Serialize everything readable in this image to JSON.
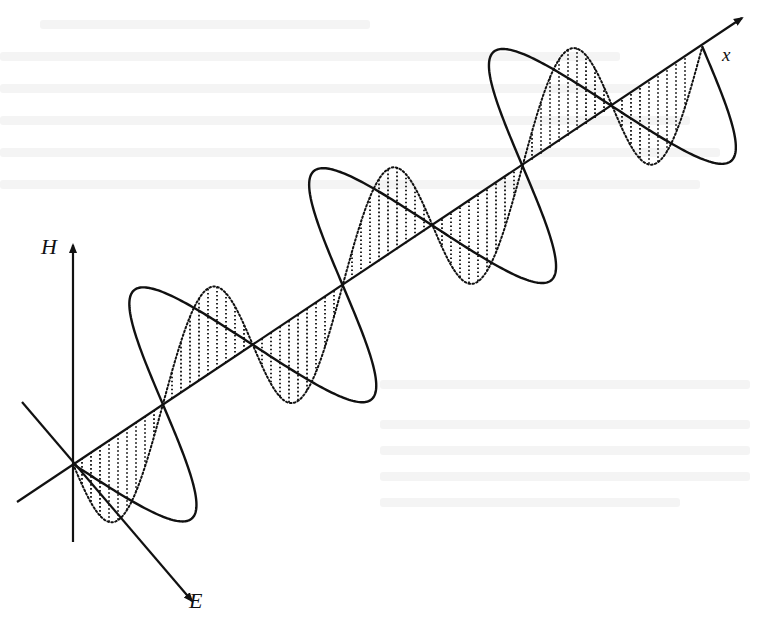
{
  "figure": {
    "background": "#ffffff",
    "stroke_color": "#111111",
    "labels": {
      "h_axis": "H",
      "e_axis": "E",
      "x_axis": "x"
    },
    "geometry": {
      "origin": [
        73,
        464
      ],
      "half_period_step": [
        89.9,
        -59.6
      ],
      "half_periods": 7,
      "x_axis": {
        "start": [
          17,
          502
        ],
        "end": [
          742,
          18
        ]
      },
      "h_axis": {
        "start": [
          73,
          542
        ],
        "end": [
          73,
          245
        ]
      },
      "e_axis": {
        "start": [
          22,
          402
        ],
        "end": [
          192,
          601
        ]
      },
      "e_direction": [
        0.65,
        0.76
      ],
      "e_amplitude": 112,
      "h_amplitude": 86,
      "hatch_spacing": 9
    },
    "series": [
      {
        "name": "E field",
        "style": "solid",
        "orientation": "along E axis"
      },
      {
        "name": "H field",
        "style": "dotted with vertical hatching",
        "orientation": "vertical (H axis)"
      }
    ]
  }
}
